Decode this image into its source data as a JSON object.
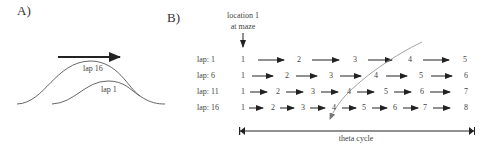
{
  "panel_a": {
    "label": "A)",
    "curve_labels": {
      "lap16": "lap 16",
      "lap1": "lap 1"
    },
    "arrow": "direction-of-travel-arrow"
  },
  "panel_b": {
    "label": "B)",
    "location_label_line1": "location 1",
    "location_label_line2": "at maze",
    "rows": [
      {
        "label": "lap: 1",
        "numbers": [
          "1",
          "2",
          "3",
          "4",
          "5"
        ]
      },
      {
        "label": "lap: 6",
        "numbers": [
          "1",
          "2",
          "3",
          "4",
          "5",
          "6"
        ]
      },
      {
        "label": "lap: 11",
        "numbers": [
          "1",
          "2",
          "3",
          "4",
          "5",
          "6",
          "7"
        ]
      },
      {
        "label": "lap: 16",
        "numbers": [
          "1",
          "2",
          "3",
          "4",
          "5",
          "6",
          "7",
          "8"
        ]
      }
    ],
    "theta_label": "theta cycle"
  },
  "colors": {
    "ink": "#333333",
    "diagonal": "#999999"
  }
}
